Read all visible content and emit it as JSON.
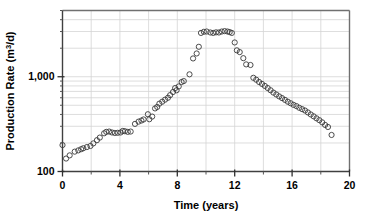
{
  "chart_data": {
    "type": "scatter",
    "title": "",
    "xlabel": "Time (years)",
    "ylabel": "Production Rate (m3/d)",
    "ylabel_prefix": "Production Rate (m",
    "ylabel_exponent": "3",
    "ylabel_suffix": "/d)",
    "yscale": "log",
    "xscale": "linear",
    "xlim": [
      0,
      20
    ],
    "ylim": [
      100,
      5000
    ],
    "xticks": [
      0,
      4,
      8,
      12,
      16,
      20
    ],
    "xtick_labels": [
      "0",
      "4",
      "8",
      "12",
      "16",
      "20"
    ],
    "xticks_minor": [
      2,
      6,
      10,
      14,
      18
    ],
    "yticks": [
      100,
      1000
    ],
    "ytick_labels": [
      "100",
      "1,000"
    ],
    "yticks_minor": [
      200,
      300,
      400,
      500,
      600,
      700,
      800,
      900,
      2000,
      3000,
      4000,
      5000
    ],
    "grid": true,
    "grid_color": "#d4d4d4",
    "axis_color": "#555555",
    "marker": "open-circle",
    "marker_size": 3.4,
    "marker_color": "#3a3a3a",
    "legend": "none",
    "series": [
      {
        "name": "Production Rate",
        "points": [
          [
            0.0,
            190
          ],
          [
            0.25,
            137
          ],
          [
            0.5,
            148
          ],
          [
            0.85,
            162
          ],
          [
            1.1,
            167
          ],
          [
            1.3,
            172
          ],
          [
            1.45,
            176
          ],
          [
            1.7,
            181
          ],
          [
            1.95,
            186
          ],
          [
            2.15,
            198
          ],
          [
            2.4,
            214
          ],
          [
            2.6,
            228
          ],
          [
            2.9,
            253
          ],
          [
            3.05,
            262
          ],
          [
            3.25,
            264
          ],
          [
            3.45,
            258
          ],
          [
            3.65,
            255
          ],
          [
            3.85,
            256
          ],
          [
            4.05,
            258
          ],
          [
            4.2,
            268
          ],
          [
            4.35,
            266
          ],
          [
            4.55,
            262
          ],
          [
            4.75,
            264
          ],
          [
            5.05,
            318
          ],
          [
            5.3,
            336
          ],
          [
            5.5,
            345
          ],
          [
            5.65,
            354
          ],
          [
            5.95,
            402
          ],
          [
            6.05,
            356
          ],
          [
            6.25,
            380
          ],
          [
            6.45,
            463
          ],
          [
            6.6,
            480
          ],
          [
            6.75,
            520
          ],
          [
            6.95,
            545
          ],
          [
            7.15,
            573
          ],
          [
            7.35,
            600
          ],
          [
            7.5,
            640
          ],
          [
            7.7,
            690
          ],
          [
            7.85,
            760
          ],
          [
            7.95,
            720
          ],
          [
            8.1,
            790
          ],
          [
            8.3,
            880
          ],
          [
            8.45,
            900
          ],
          [
            8.85,
            1060
          ],
          [
            9.1,
            1560
          ],
          [
            9.35,
            1760
          ],
          [
            9.5,
            2070
          ],
          [
            9.65,
            2900
          ],
          [
            9.85,
            2980
          ],
          [
            10.05,
            3000
          ],
          [
            10.3,
            2930
          ],
          [
            10.5,
            2900
          ],
          [
            10.7,
            2940
          ],
          [
            10.9,
            2930
          ],
          [
            11.1,
            3000
          ],
          [
            11.3,
            3030
          ],
          [
            11.5,
            3000
          ],
          [
            11.65,
            2960
          ],
          [
            11.8,
            2900
          ],
          [
            12.0,
            2300
          ],
          [
            12.15,
            1900
          ],
          [
            12.35,
            1820
          ],
          [
            12.6,
            1570
          ],
          [
            12.8,
            1350
          ],
          [
            13.1,
            1330
          ],
          [
            13.3,
            975
          ],
          [
            13.5,
            930
          ],
          [
            13.7,
            880
          ],
          [
            13.9,
            840
          ],
          [
            14.1,
            800
          ],
          [
            14.3,
            760
          ],
          [
            14.5,
            720
          ],
          [
            14.7,
            680
          ],
          [
            14.9,
            650
          ],
          [
            15.1,
            620
          ],
          [
            15.3,
            595
          ],
          [
            15.5,
            570
          ],
          [
            15.7,
            545
          ],
          [
            15.9,
            525
          ],
          [
            16.1,
            505
          ],
          [
            16.3,
            490
          ],
          [
            16.5,
            470
          ],
          [
            16.7,
            455
          ],
          [
            16.9,
            440
          ],
          [
            17.1,
            420
          ],
          [
            17.3,
            400
          ],
          [
            17.5,
            382
          ],
          [
            17.7,
            364
          ],
          [
            17.9,
            348
          ],
          [
            18.1,
            330
          ],
          [
            18.3,
            310
          ],
          [
            18.5,
            295
          ],
          [
            18.75,
            243
          ]
        ]
      }
    ]
  }
}
